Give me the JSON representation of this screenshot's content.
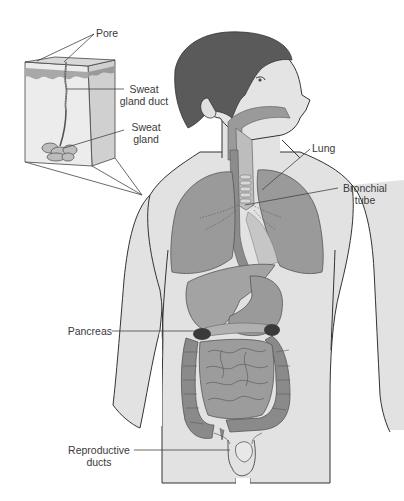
{
  "diagram": {
    "colors": {
      "skin": "#e2e2e2",
      "skin_shade": "#d3d3d3",
      "hair": "#5a5a5a",
      "organ": "#9a9a9a",
      "organ_dark": "#7c7c7c",
      "outline": "#333333",
      "leader_line": "#444444",
      "text": "#3a3a3a"
    },
    "labels": {
      "pore": "Pore",
      "sweat_gland_duct_1": "Sweat",
      "sweat_gland_duct_2": "gland duct",
      "sweat_gland_1": "Sweat",
      "sweat_gland_2": "gland",
      "lung": "Lung",
      "bronchial_tube_1": "Bronchial",
      "bronchial_tube_2": "tube",
      "pancreas": "Pancreas",
      "reproductive_ducts_1": "Reproductive",
      "reproductive_ducts_2": "ducts"
    }
  }
}
